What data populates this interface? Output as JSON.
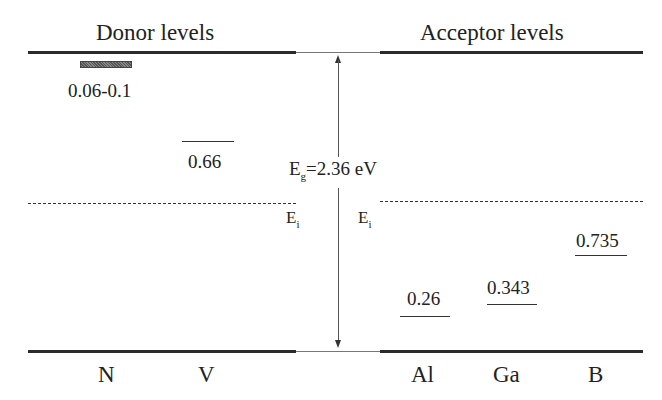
{
  "diagram": {
    "headers": {
      "donor": "Donor levels",
      "acceptor": "Acceptor levels"
    },
    "bandgap_label": {
      "symbol": "E",
      "subscript": "g",
      "value": "=2.36 eV"
    },
    "intrinsic_label_left": {
      "symbol": "E",
      "subscript": "i"
    },
    "intrinsic_label_right": {
      "symbol": "E",
      "subscript": "i"
    },
    "donor_levels": [
      {
        "element": "N",
        "energy": "0.06-0.1",
        "style": "hatched-band"
      },
      {
        "element": "V",
        "energy": "0.66",
        "style": "line"
      }
    ],
    "acceptor_levels": [
      {
        "element": "Al",
        "energy": "0.26"
      },
      {
        "element": "Ga",
        "energy": "0.343"
      },
      {
        "element": "B",
        "energy": "0.735"
      }
    ],
    "colors": {
      "band_edge": "#2b2b2b",
      "level_line": "#333333",
      "background": "#ffffff"
    }
  }
}
